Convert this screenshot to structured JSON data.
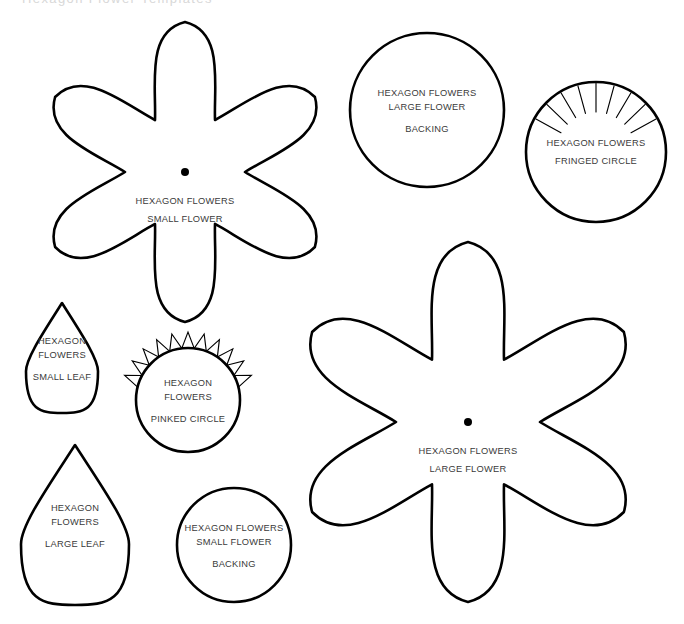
{
  "page": {
    "background_color": "#ffffff",
    "stroke_color": "#000000",
    "text_color": "#3a3a3a",
    "width": 684,
    "height": 624,
    "cutoff_header": "Hexagon Flower Templates"
  },
  "brand": "HEXAGON FLOWERS",
  "templates": [
    {
      "id": "small-flower",
      "type": "flower",
      "petals": 6,
      "brand_label": "HEXAGON FLOWERS",
      "name_label": "SMALL FLOWER",
      "has_center_dot": true,
      "center": {
        "x": 185,
        "y": 172
      },
      "outer_radius": 150,
      "inner_radius": 60,
      "label_lines": [
        "HEXAGON FLOWERS",
        "SMALL FLOWER"
      ]
    },
    {
      "id": "large-flower-backing",
      "type": "circle",
      "brand_label": "HEXAGON FLOWERS",
      "name_label": "LARGE FLOWER BACKING",
      "has_center_dot": false,
      "center": {
        "x": 427,
        "y": 110
      },
      "radius": 77,
      "label_lines": [
        "HEXAGON FLOWERS",
        "LARGE FLOWER",
        "BACKING"
      ]
    },
    {
      "id": "fringed-circle",
      "type": "fringed-circle",
      "brand_label": "HEXAGON FLOWERS",
      "name_label": "FRINGED CIRCLE",
      "has_center_dot": false,
      "center": {
        "x": 596,
        "y": 152
      },
      "radius": 70,
      "fringe_count": 9,
      "fringe_depth": 30,
      "label_lines": [
        "HEXAGON FLOWERS",
        "FRINGED CIRCLE"
      ]
    },
    {
      "id": "small-leaf",
      "type": "teardrop",
      "brand_label": "HEXAGON FLOWERS",
      "name_label": "SMALL LEAF",
      "has_center_dot": false,
      "center": {
        "x": 62,
        "y": 358
      },
      "width": 72,
      "height": 110,
      "label_lines": [
        "HEXAGON",
        "FLOWERS",
        "SMALL LEAF"
      ]
    },
    {
      "id": "pinked-circle",
      "type": "pinked-circle",
      "brand_label": "HEXAGON FLOWERS",
      "name_label": "PINKED CIRCLE",
      "has_center_dot": false,
      "center": {
        "x": 188,
        "y": 400
      },
      "radius": 52,
      "teeth_count": 11,
      "tooth_depth": 16,
      "label_lines": [
        "HEXAGON",
        "FLOWERS",
        "PINKED CIRCLE"
      ]
    },
    {
      "id": "large-flower",
      "type": "flower",
      "petals": 6,
      "brand_label": "HEXAGON FLOWERS",
      "name_label": "LARGE FLOWER",
      "has_center_dot": true,
      "center": {
        "x": 468,
        "y": 422
      },
      "outer_radius": 180,
      "inner_radius": 72,
      "label_lines": [
        "HEXAGON FLOWERS",
        "LARGE FLOWER"
      ]
    },
    {
      "id": "large-leaf",
      "type": "teardrop",
      "brand_label": "HEXAGON FLOWERS",
      "name_label": "LARGE LEAF",
      "has_center_dot": false,
      "center": {
        "x": 75,
        "y": 525
      },
      "width": 108,
      "height": 160,
      "label_lines": [
        "HEXAGON",
        "FLOWERS",
        "LARGE LEAF"
      ]
    },
    {
      "id": "small-flower-backing",
      "type": "circle",
      "brand_label": "HEXAGON FLOWERS",
      "name_label": "SMALL FLOWER BACKING",
      "has_center_dot": false,
      "center": {
        "x": 234,
        "y": 545
      },
      "radius": 57,
      "label_lines": [
        "HEXAGON FLOWERS",
        "SMALL FLOWER",
        "BACKING"
      ]
    }
  ]
}
